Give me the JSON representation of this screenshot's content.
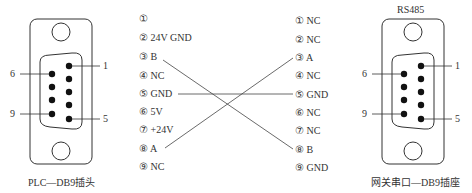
{
  "left_connector": {
    "caption": "PLC—DB9插头",
    "pin_numbers": [
      "1",
      "5",
      "6",
      "9"
    ]
  },
  "right_connector": {
    "title": "RS485",
    "caption": "网关串口—DB9插座",
    "pin_numbers": [
      "1",
      "5",
      "6",
      "9"
    ]
  },
  "left_pins": [
    {
      "num": "①",
      "label": ""
    },
    {
      "num": "②",
      "label": "24V GND"
    },
    {
      "num": "③",
      "label": "B"
    },
    {
      "num": "④",
      "label": "NC"
    },
    {
      "num": "⑤",
      "label": "GND"
    },
    {
      "num": "⑥",
      "label": "5V"
    },
    {
      "num": "⑦",
      "label": "+24V"
    },
    {
      "num": "⑧",
      "label": "A"
    },
    {
      "num": "⑨",
      "label": "NC"
    }
  ],
  "right_pins": [
    {
      "num": "①",
      "label": "NC"
    },
    {
      "num": "②",
      "label": "NC"
    },
    {
      "num": "③",
      "label": "A"
    },
    {
      "num": "④",
      "label": "NC"
    },
    {
      "num": "⑤",
      "label": "GND"
    },
    {
      "num": "⑥",
      "label": "NC"
    },
    {
      "num": "⑦",
      "label": "NC"
    },
    {
      "num": "⑧",
      "label": "B"
    },
    {
      "num": "⑨",
      "label": "GND"
    }
  ],
  "connections": [
    {
      "from": "left ③ B",
      "to": "right ⑧ B"
    },
    {
      "from": "left ⑤ GND",
      "to": "right ⑤ GND"
    },
    {
      "from": "left ⑧ A",
      "to": "right ③ A"
    }
  ]
}
